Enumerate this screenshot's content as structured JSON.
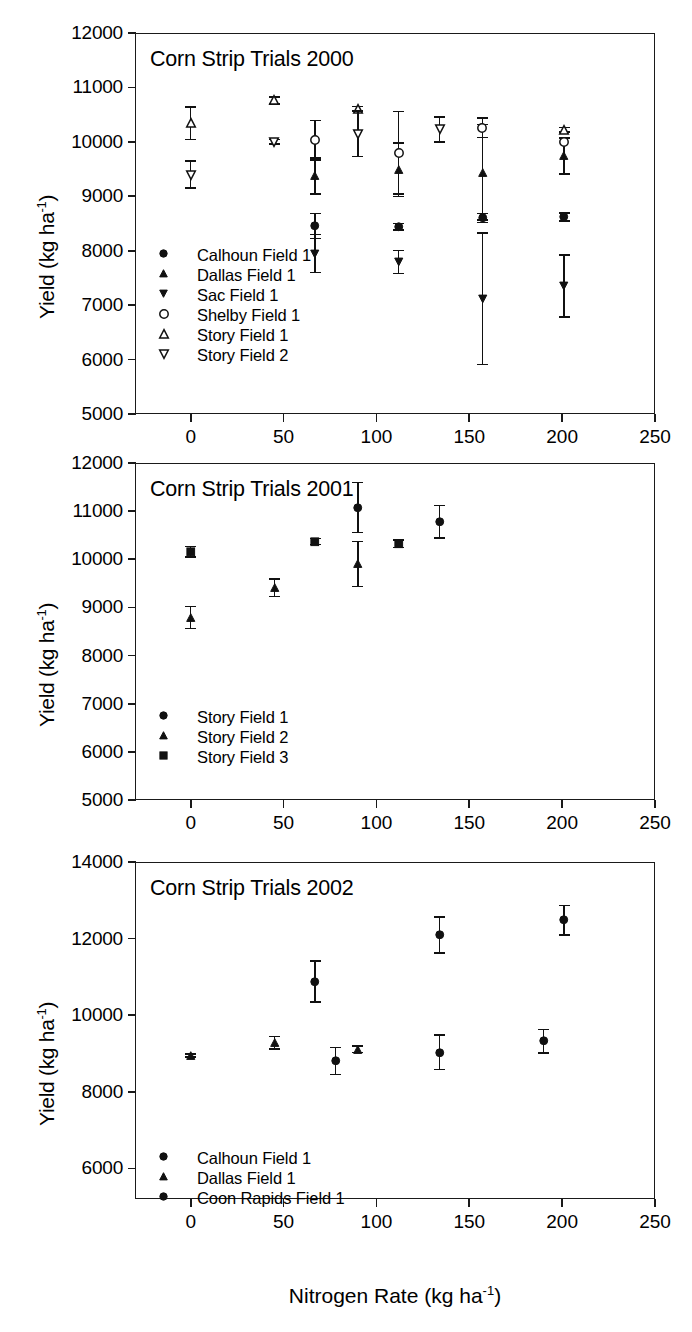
{
  "figure": {
    "axis_titles": {
      "x": "Nitrogen Rate (kg ha",
      "x_sup": "-1",
      "x_end": ")",
      "y": "Yield (kg ha",
      "y_sup": "-1",
      "y_end": ")"
    }
  },
  "chart_data": [
    {
      "type": "scatter",
      "title": "Corn Strip Trials 2000",
      "xlabel": "Nitrogen Rate (kg ha-1)",
      "ylabel": "Yield (kg ha-1)",
      "xlim": [
        -30,
        250
      ],
      "ylim": [
        5000,
        12000
      ],
      "xticks": [
        0,
        50,
        100,
        150,
        200,
        250
      ],
      "yticks": [
        5000,
        6000,
        7000,
        8000,
        9000,
        10000,
        11000,
        12000
      ],
      "grid": false,
      "legend_position": "lower-left",
      "series": [
        {
          "name": "Calhoun Field 1",
          "marker": "filled-circle",
          "points": [
            {
              "x": 67,
              "y": 8450,
              "err": 230
            },
            {
              "x": 112,
              "y": 8440,
              "err": 60
            },
            {
              "x": 157,
              "y": 8600,
              "err": 80
            },
            {
              "x": 201,
              "y": 8620,
              "err": 70
            }
          ]
        },
        {
          "name": "Dallas Field 1",
          "marker": "filled-triangle-up",
          "points": [
            {
              "x": 67,
              "y": 9370,
              "err": 330
            },
            {
              "x": 112,
              "y": 9490,
              "err": 490
            },
            {
              "x": 157,
              "y": 9440,
              "err": 880
            },
            {
              "x": 201,
              "y": 9740,
              "err": 330
            }
          ]
        },
        {
          "name": "Sac Field 1",
          "marker": "filled-triangle-down",
          "points": [
            {
              "x": 67,
              "y": 7950,
              "err": 350
            },
            {
              "x": 112,
              "y": 7790,
              "err": 210
            },
            {
              "x": 157,
              "y": 7120,
              "err": 1210
            },
            {
              "x": 201,
              "y": 7350,
              "err": 570
            }
          ]
        },
        {
          "name": "Shelby Field 1",
          "marker": "open-circle",
          "points": [
            {
              "x": 67,
              "y": 10030,
              "err": 360
            },
            {
              "x": 112,
              "y": 9800,
              "err": 760
            },
            {
              "x": 157,
              "y": 10260,
              "err": 180
            },
            {
              "x": 201,
              "y": 10000,
              "err": 0
            }
          ]
        },
        {
          "name": "Story Field 1",
          "marker": "open-triangle-up",
          "points": [
            {
              "x": 0,
              "y": 10340,
              "err": 300
            },
            {
              "x": 45,
              "y": 10760,
              "err": 60
            },
            {
              "x": 90,
              "y": 10610,
              "err": 40
            },
            {
              "x": 201,
              "y": 10220,
              "err": 40
            }
          ]
        },
        {
          "name": "Story Field 2",
          "marker": "open-triangle-down",
          "points": [
            {
              "x": 0,
              "y": 9400,
              "err": 250
            },
            {
              "x": 45,
              "y": 10000,
              "err": 40
            },
            {
              "x": 90,
              "y": 10150,
              "err": 420
            },
            {
              "x": 134,
              "y": 10230,
              "err": 230
            }
          ]
        }
      ]
    },
    {
      "type": "scatter",
      "title": "Corn Strip Trials 2001",
      "xlabel": "Nitrogen Rate (kg ha-1)",
      "ylabel": "Yield (kg ha-1)",
      "xlim": [
        -30,
        250
      ],
      "ylim": [
        5000,
        12000
      ],
      "xticks": [
        0,
        50,
        100,
        150,
        200,
        250
      ],
      "yticks": [
        5000,
        6000,
        7000,
        8000,
        9000,
        10000,
        11000,
        12000
      ],
      "grid": false,
      "legend_position": "lower-left",
      "series": [
        {
          "name": "Story Field 1",
          "marker": "filled-circle",
          "points": [
            {
              "x": 90,
              "y": 11080,
              "err": 520
            },
            {
              "x": 134,
              "y": 10780,
              "err": 340
            }
          ]
        },
        {
          "name": "Story Field 2",
          "marker": "filled-triangle-up",
          "points": [
            {
              "x": 0,
              "y": 8790,
              "err": 230
            },
            {
              "x": 45,
              "y": 9410,
              "err": 180
            },
            {
              "x": 90,
              "y": 9900,
              "err": 470
            }
          ]
        },
        {
          "name": "Story Field 3",
          "marker": "filled-square",
          "points": [
            {
              "x": 0,
              "y": 10160,
              "err": 110
            },
            {
              "x": 67,
              "y": 10370,
              "err": 60
            },
            {
              "x": 112,
              "y": 10320,
              "err": 80
            }
          ]
        }
      ]
    },
    {
      "type": "scatter",
      "title": "Corn Strip Trials 2002",
      "xlabel": "Nitrogen Rate (kg ha-1)",
      "ylabel": "Yield (kg ha-1)",
      "xlim": [
        -30,
        250
      ],
      "ylim": [
        5200,
        14000
      ],
      "xticks": [
        0,
        50,
        100,
        150,
        200,
        250
      ],
      "yticks": [
        6000,
        8000,
        10000,
        12000,
        14000
      ],
      "grid": false,
      "legend_position": "lower-left",
      "series": [
        {
          "name": "Calhoun Field 1",
          "marker": "filled-circle",
          "points": [
            {
              "x": 67,
              "y": 10880,
              "err": 530
            },
            {
              "x": 134,
              "y": 12090,
              "err": 470
            },
            {
              "x": 201,
              "y": 12480,
              "err": 390
            }
          ]
        },
        {
          "name": "Dallas Field 1",
          "marker": "filled-triangle-up",
          "points": [
            {
              "x": 0,
              "y": 8950,
              "err": 40
            },
            {
              "x": 45,
              "y": 9280,
              "err": 160
            },
            {
              "x": 90,
              "y": 9110,
              "err": 90
            }
          ]
        },
        {
          "name": "Coon Rapids Field 1",
          "marker": "filled-circle",
          "points": [
            {
              "x": 78,
              "y": 8800,
              "err": 350
            },
            {
              "x": 134,
              "y": 9030,
              "err": 450
            },
            {
              "x": 190,
              "y": 9320,
              "err": 310
            }
          ]
        }
      ]
    }
  ]
}
